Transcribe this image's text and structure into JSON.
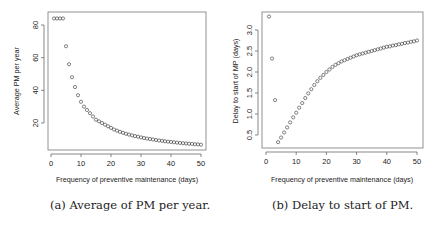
{
  "chart_data": [
    {
      "type": "scatter",
      "id": "a",
      "title": "",
      "caption": "(a) Average of PM per year.",
      "xlabel": "Frequency of preventive maintenance (days)",
      "ylabel": "Average PM per year",
      "xlim": [
        0,
        50
      ],
      "ylim": [
        5,
        86
      ],
      "xticks": [
        0,
        10,
        20,
        30,
        40,
        50
      ],
      "yticks": [
        20,
        40,
        60,
        80
      ],
      "grid": false,
      "legend": null,
      "x": [
        1,
        2,
        3,
        4,
        5,
        6,
        7,
        8,
        9,
        10,
        11,
        12,
        13,
        14,
        15,
        16,
        17,
        18,
        19,
        20,
        21,
        22,
        23,
        24,
        25,
        26,
        27,
        28,
        29,
        30,
        31,
        32,
        33,
        34,
        35,
        36,
        37,
        38,
        39,
        40,
        41,
        42,
        43,
        44,
        45,
        46,
        47,
        48,
        49,
        50
      ],
      "values": [
        84,
        84,
        84,
        84,
        67,
        56,
        48,
        42,
        37,
        33,
        30,
        28,
        26,
        24,
        22,
        21,
        20,
        19,
        18,
        17,
        16,
        15.3,
        14.6,
        14,
        13.4,
        12.9,
        12.4,
        12,
        11.6,
        11.2,
        10.8,
        10.5,
        10.2,
        9.9,
        9.6,
        9.3,
        9.1,
        8.8,
        8.6,
        8.4,
        8.2,
        8,
        7.8,
        7.6,
        7.5,
        7.3,
        7.2,
        7,
        6.9,
        6.7
      ]
    },
    {
      "type": "scatter",
      "id": "b",
      "title": "",
      "caption": "(b) Delay to start of PM.",
      "xlabel": "Frequency of preventive maintenance (days)",
      "ylabel": "Delay to start of MP (days)",
      "xlim": [
        0,
        50
      ],
      "ylim": [
        0.2,
        3.4
      ],
      "xticks": [
        0,
        10,
        20,
        30,
        40,
        50
      ],
      "yticks": [
        0.5,
        1.0,
        1.5,
        2.0,
        2.5,
        3.0
      ],
      "grid": false,
      "legend": null,
      "x": [
        1,
        2,
        3,
        4,
        5,
        6,
        7,
        8,
        9,
        10,
        11,
        12,
        13,
        14,
        15,
        16,
        17,
        18,
        19,
        20,
        21,
        22,
        23,
        24,
        25,
        26,
        27,
        28,
        29,
        30,
        31,
        32,
        33,
        34,
        35,
        36,
        37,
        38,
        39,
        40,
        41,
        42,
        43,
        44,
        45,
        46,
        47,
        48,
        49,
        50
      ],
      "values": [
        3.32,
        2.32,
        1.33,
        0.33,
        0.44,
        0.56,
        0.68,
        0.8,
        0.92,
        1.03,
        1.15,
        1.26,
        1.38,
        1.49,
        1.59,
        1.69,
        1.78,
        1.86,
        1.93,
        2.0,
        2.06,
        2.12,
        2.17,
        2.21,
        2.25,
        2.28,
        2.31,
        2.34,
        2.37,
        2.4,
        2.42,
        2.44,
        2.46,
        2.48,
        2.5,
        2.52,
        2.54,
        2.56,
        2.58,
        2.6,
        2.61,
        2.63,
        2.64,
        2.66,
        2.67,
        2.69,
        2.7,
        2.72,
        2.73,
        2.75
      ]
    }
  ],
  "figure": {
    "panel_a": {
      "caption": "(a) Average of PM per year.",
      "xlabel": "Frequency of preventive maintenance (days)",
      "ylabel": "Average PM per year",
      "xtick_labels": [
        "0",
        "10",
        "20",
        "30",
        "40",
        "50"
      ],
      "ytick_labels": [
        "20",
        "40",
        "60",
        "80"
      ]
    },
    "panel_b": {
      "caption": "(b) Delay to start of PM.",
      "xlabel": "Frequency of preventive maintenance (days)",
      "ylabel": "Delay to start of MP (days)",
      "xtick_labels": [
        "0",
        "10",
        "20",
        "30",
        "40",
        "50"
      ],
      "ytick_labels": [
        "0.5",
        "1.0",
        "1.5",
        "2.0",
        "2.5",
        "3.0"
      ]
    }
  },
  "style": {
    "axis_color": "#555555",
    "marker_color": "#333333",
    "text_color": "#222222"
  }
}
